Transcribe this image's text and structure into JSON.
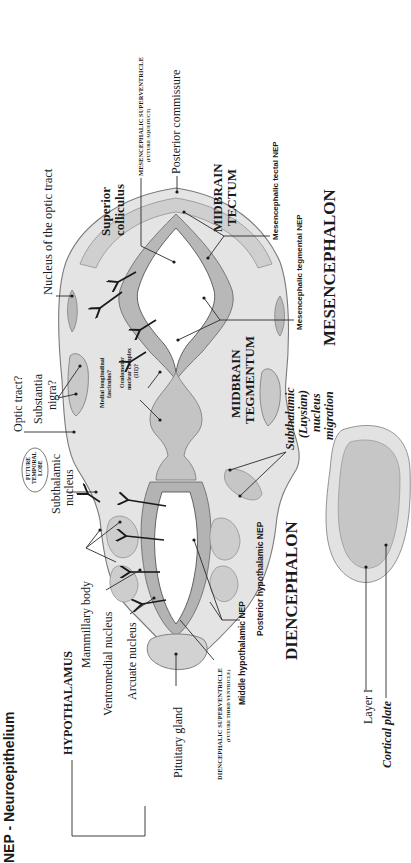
{
  "figure": {
    "title": "NEP - Neuroepithelium",
    "orientation": "rotated 90 degrees counter-clockwise",
    "colors": {
      "background": "#ffffff",
      "tissue_light": "#e4e4e4",
      "tissue_mid": "#c9c9c9",
      "tissue_dark": "#a6a6a6",
      "ventricle": "#ffffff",
      "ink": "#1a1a1a"
    }
  },
  "regions": {
    "diencephalon": "DIENCEPHALON",
    "mesencephalon": "MESENCEPHALON",
    "hypothalamus": "HYPOTHALAMUS",
    "future_temporal_lobe": "FUTURE TEMPORAL LOBE",
    "midbrain_tectum_1": "MIDBRAIN",
    "midbrain_tectum_2": "TECTUM",
    "midbrain_tegmentum_1": "MIDBRAIN",
    "midbrain_tegmentum_2": "TEGMENTUM"
  },
  "labels": {
    "nucleus_optic_tract": "Nucleus of the optic tract",
    "superior_colliculus_1": "Superior",
    "superior_colliculus_2": "colliculus",
    "mes_superventricle": "MESENCEPHALIC SUPERVENTRICLE",
    "mes_superventricle_sub": "(FUTURE AQUEDUCT)",
    "posterior_commissure": "Posterior commissure",
    "mes_tectal_nep": "Mesencephalic tectal NEP",
    "mes_tegmental_nep": "Mesencephalic tegmental NEP",
    "optic_tract": "Optic tract?",
    "substantia_nigra_1": "Substantia",
    "substantia_nigra_2": "nigra?",
    "medial_longitudinal_1": "Medial longitudinal",
    "medial_longitudinal_2": "fasciculus?",
    "oculomotor_1": "Oculomotor",
    "oculomotor_2": "nuclear complex",
    "oculomotor_3": "(III)?",
    "subthalamic_nucleus_1": "Subthalamic",
    "subthalamic_nucleus_2": "nucleus",
    "subthalamic_migration_1": "Subthalamic",
    "subthalamic_migration_2": "(Luysian)",
    "subthalamic_migration_3": "nucleus",
    "subthalamic_migration_4": "migration",
    "mammillary_body": "Mammillary body",
    "ventromedial_nucleus": "Ventromedial nucleus",
    "arcuate_nucleus": "Arcuate nucleus",
    "pituitary_gland": "Pituitary gland",
    "dien_superventricle": "DIENCEPHALIC SUPERVENTRICLE",
    "dien_superventricle_sub": "(FUTURE THIRD VENTRICLE)",
    "middle_hypothalamic_nep": "Middle hypothalamic NEP",
    "posterior_hypothalamic_nep": "Posterior hypothalamic NEP",
    "layer_1": "Layer I",
    "cortical_plate": "Cortical plate"
  }
}
